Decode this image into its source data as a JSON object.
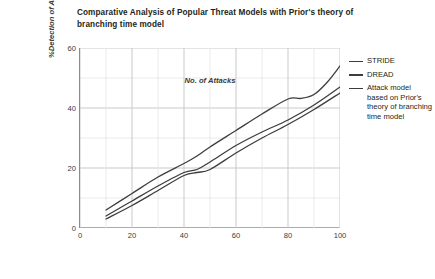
{
  "chart_data": {
    "type": "line",
    "title": "Comparative Analysis of Popular Threat Models with Prior's theory of branching time model",
    "subtitle": "",
    "xlabel": "No. of Attacks",
    "ylabel": "%Detection of Attacks",
    "xlim": [
      0,
      100
    ],
    "ylim": [
      0,
      60
    ],
    "xticks": [
      0,
      20,
      40,
      60,
      80,
      100
    ],
    "yticks": [
      0,
      20,
      40,
      60
    ],
    "xminor_step": 10,
    "yminor_step": 10,
    "grid": true,
    "legend_position": "right",
    "series": [
      {
        "name": "STRIDE",
        "color": "#3d3d3d",
        "x": [
          10,
          20,
          30,
          40,
          45,
          50,
          60,
          70,
          80,
          90,
          100
        ],
        "values": [
          4.0,
          9.0,
          14.0,
          18.5,
          19.5,
          22.0,
          27.5,
          32.0,
          36.0,
          41.0,
          47.0
        ]
      },
      {
        "name": "DREAD",
        "color": "#3d3d3d",
        "x": [
          10,
          20,
          30,
          40,
          45,
          50,
          60,
          70,
          80,
          90,
          100
        ],
        "values": [
          3.0,
          7.5,
          12.5,
          17.5,
          18.5,
          19.5,
          25.0,
          30.0,
          34.5,
          39.5,
          45.0
        ]
      },
      {
        "name": "Attack model based on Prior's theory of branching time model",
        "color": "#3d3d3d",
        "x": [
          10,
          20,
          30,
          40,
          45,
          50,
          60,
          70,
          80,
          85,
          90,
          95,
          100
        ],
        "values": [
          6.0,
          11.5,
          17.0,
          21.5,
          24.0,
          27.0,
          32.5,
          38.0,
          43.0,
          43.2,
          44.5,
          48.5,
          54.0
        ]
      }
    ]
  },
  "legend": {
    "entries": [
      {
        "label": "STRIDE"
      },
      {
        "label": "DREAD"
      },
      {
        "label": "Attack model based on Prior's theory of branching time model"
      }
    ]
  }
}
